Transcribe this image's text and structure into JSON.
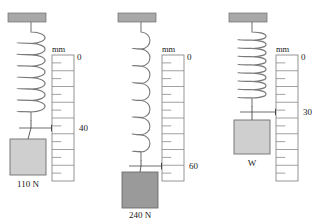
{
  "figure": {
    "title": "",
    "width": 317,
    "height": 224,
    "background": "#ffffff"
  },
  "colors": {
    "ceiling_bracket": "#a8a8a8",
    "spring_stroke": "#7a7a7a",
    "ruler_stroke": "#8a8a8a",
    "block_light": "#cfcfcf",
    "block_dark": "#9a9a9a",
    "block_border": "#6e6e6e",
    "text": "#1a1a1a",
    "pointer": "#111111"
  },
  "setups": [
    {
      "id": "setup-1",
      "block_label": "110 N",
      "block_fill": "#cfcfcf",
      "reading": "40",
      "scale_unit": "mm",
      "scale_zero": "0",
      "spring_coils": 7,
      "spring_state": "short",
      "origin_x": 8,
      "ceiling_y": 13,
      "ceiling_w": 38,
      "ceiling_h": 9,
      "spring_cx": 31,
      "spring_top": 22,
      "spring_bottom": 120,
      "coil_rx": 11,
      "coil_ry": 7,
      "pointer_y": 128,
      "block_x": 10,
      "block_y": 139,
      "block_w": 36,
      "block_h": 36,
      "block_label_y": 187,
      "ruler_x": 52,
      "ruler_y": 55,
      "ruler_w": 22,
      "ruler_h": 126,
      "ruler_divisions": 8,
      "unit_x": 52,
      "unit_y": 52,
      "zero_x": 77,
      "zero_y": 60,
      "reading_x": 79,
      "reading_y": 131
    },
    {
      "id": "setup-2",
      "block_label": "240 N",
      "block_fill": "#9a9a9a",
      "reading": "60",
      "scale_unit": "mm",
      "scale_zero": "0",
      "spring_coils": 7,
      "spring_state": "stretched",
      "origin_x": 118,
      "ceiling_y": 13,
      "ceiling_w": 38,
      "ceiling_h": 9,
      "spring_cx": 141,
      "spring_top": 22,
      "spring_bottom": 160,
      "coil_rx": 7,
      "coil_ry": 5,
      "pointer_y": 166,
      "block_x": 122,
      "block_y": 172,
      "block_w": 36,
      "block_h": 36,
      "block_label_y": 218,
      "ruler_x": 162,
      "ruler_y": 55,
      "ruler_w": 22,
      "ruler_h": 126,
      "ruler_divisions": 8,
      "unit_x": 162,
      "unit_y": 52,
      "zero_x": 187,
      "zero_y": 60,
      "reading_x": 189,
      "reading_y": 169
    },
    {
      "id": "setup-3",
      "block_label": "W",
      "block_fill": "#cfcfcf",
      "reading": "30",
      "scale_unit": "mm",
      "scale_zero": "0",
      "spring_coils": 8,
      "spring_state": "medium",
      "origin_x": 229,
      "ceiling_y": 13,
      "ceiling_w": 38,
      "ceiling_h": 9,
      "spring_cx": 252,
      "spring_top": 22,
      "spring_bottom": 106,
      "coil_rx": 11,
      "coil_ry": 6,
      "pointer_y": 112,
      "block_x": 234,
      "block_y": 120,
      "block_w": 36,
      "block_h": 34,
      "block_label_y": 166,
      "ruler_x": 276,
      "ruler_y": 55,
      "ruler_w": 22,
      "ruler_h": 126,
      "ruler_divisions": 8,
      "unit_x": 276,
      "unit_y": 52,
      "zero_x": 301,
      "zero_y": 60,
      "reading_x": 303,
      "reading_y": 115
    }
  ],
  "chart_data": {
    "type": "diagram",
    "ylabel": "mm",
    "categories": [
      "110 N",
      "240 N",
      "W"
    ],
    "values": [
      40,
      60,
      30
    ],
    "units": "mm",
    "scale_zero_at_top": true
  }
}
